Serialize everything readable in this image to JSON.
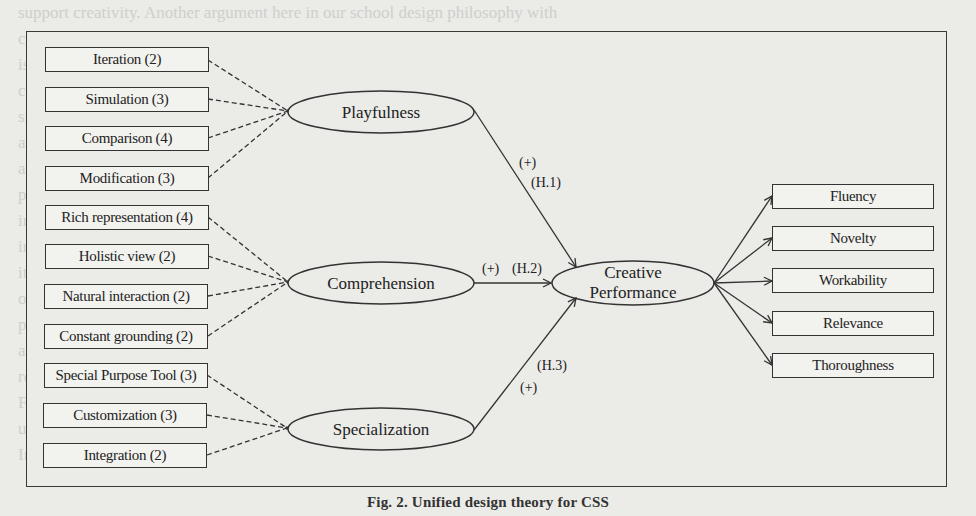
{
  "figure": {
    "caption": "Fig. 2. Unified design theory for CSS",
    "background_text": [
      "support creativity. Another argument here in our school design philosophy with",
      "comprehension of the situation and its implications. Dynamic, shared understanding",
      "is embodied and expressed with graphics and models (Hewett 2005; Shneiderman and",
      "colleagues 2006). The goal of rich representation is to give a holistic view of the",
      "situation through which people can see patterns and explore alternative solutions",
      "and manipulate the model naturally. Through continuous refinement designs evolve",
      "and remain grounded in the problem context (Hevner 2004; Gregor 2007). The study",
      "proposes a set of supporting functions of rich representation, holistic view, natural",
      "interaction and constant grounding as aspects of a comprehension-oriented design",
      "in CSS. Specialization refers to the degree to which a tool is fitted to the task domain,",
      "its users and its context. Special purpose tools, customization, and integration with",
      "other systems and data are examined in this light. Together these constructs form the",
      "proposed unified design theory. We hypothesize that each construct positively",
      "affects creative performance as measured by fluency, novelty, workability and",
      "relevance, and thoroughness of the generated ideas in the design sessions studied.",
      "Finally, the study tested this model with an empirical evaluation of two systems,",
      "using the dimensions of creative performance to assess the support functions.",
      "In sum, the theory integrates three perspectives on creativity support systems."
    ]
  },
  "constructs": [
    {
      "id": "playfulness",
      "label": "Playfulness",
      "hypothesis": "(H.1)",
      "sign": "(+)",
      "indicators": [
        {
          "label": "Iteration (2)"
        },
        {
          "label": "Simulation (3)"
        },
        {
          "label": "Comparison (4)"
        },
        {
          "label": "Modification (3)"
        }
      ]
    },
    {
      "id": "comprehension",
      "label": "Comprehension",
      "hypothesis": "(H.2)",
      "sign": "(+)",
      "indicators": [
        {
          "label": "Rich representation (4)"
        },
        {
          "label": "Holistic view (2)"
        },
        {
          "label": "Natural interaction (2)"
        },
        {
          "label": "Constant grounding (2)"
        }
      ]
    },
    {
      "id": "specialization",
      "label": "Specialization",
      "hypothesis": "(H.3)",
      "sign": "(+)",
      "indicators": [
        {
          "label": "Special Purpose Tool (3)"
        },
        {
          "label": "Customization (3)"
        },
        {
          "label": "Integration (2)"
        }
      ]
    }
  ],
  "outcome": {
    "label_line1": "Creative",
    "label_line2": "Performance",
    "dimensions": [
      {
        "label": "Fluency"
      },
      {
        "label": "Novelty"
      },
      {
        "label": "Workability"
      },
      {
        "label": "Relevance"
      },
      {
        "label": "Thoroughness"
      }
    ]
  },
  "colors": {
    "line": "#333333",
    "background": "#ebebe8",
    "box_fill": "#f2f2ef"
  }
}
